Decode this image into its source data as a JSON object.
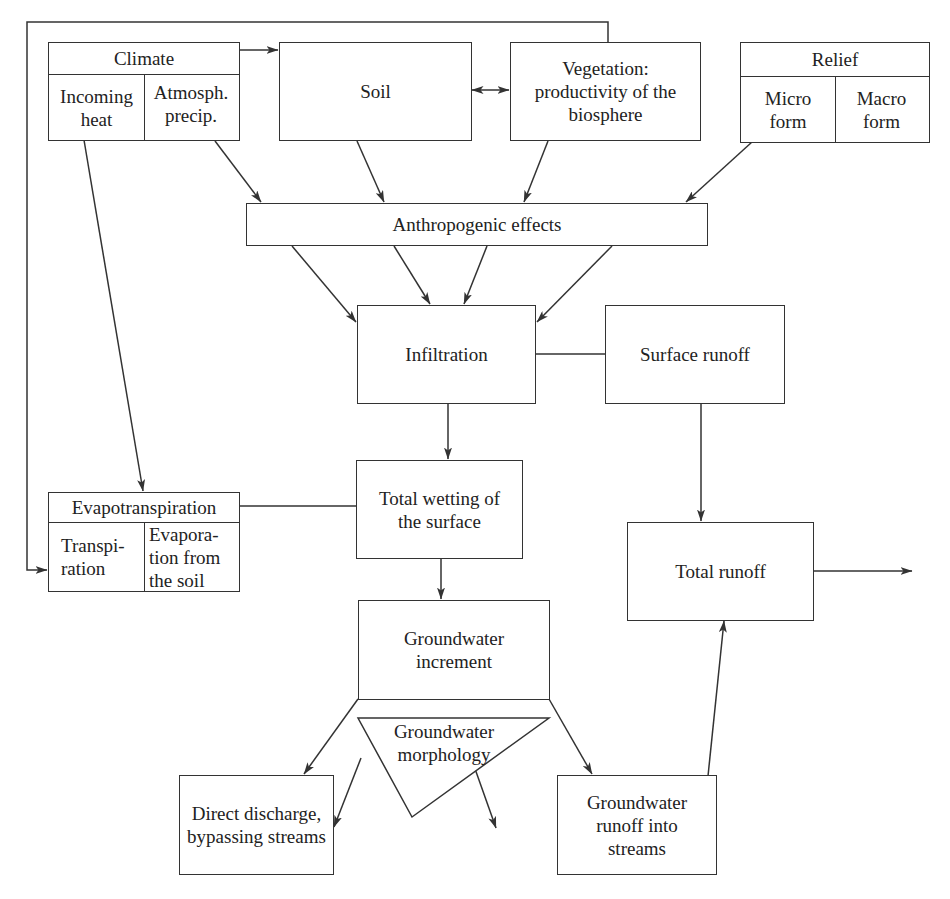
{
  "diagram": {
    "type": "flowchart",
    "colors": {
      "line": "#333333",
      "text": "#222222",
      "background": "#ffffff"
    },
    "nodes": {
      "climate": {
        "title": "Climate",
        "left": "Incoming heat",
        "right": "Atmosph. precip."
      },
      "soil": {
        "label": "Soil"
      },
      "vegetation": {
        "label": "Vegetation: productivity of the biosphere"
      },
      "relief": {
        "title": "Relief",
        "left": "Micro form",
        "right": "Macro form"
      },
      "anthropogenic": {
        "label": "Anthropogenic effects"
      },
      "infiltration": {
        "label": "Infiltration"
      },
      "surface_runoff": {
        "label": "Surface runoff"
      },
      "total_wetting": {
        "label": "Total wetting of the surface"
      },
      "evapotranspiration": {
        "title": "Evapotranspiration",
        "left": "Transpi- ration",
        "right": "Evapora- tion from the soil"
      },
      "total_runoff": {
        "label": "Total runoff"
      },
      "groundwater_increment": {
        "label": "Groundwater increment"
      },
      "groundwater_morphology": {
        "label": "Groundwater morphology"
      },
      "direct_discharge": {
        "label": "Direct discharge, bypassing streams"
      },
      "groundwater_runoff": {
        "label": "Groundwater runoff into streams"
      }
    },
    "edges": [
      {
        "from": "climate",
        "to": "soil",
        "arrow": true
      },
      {
        "from": "soil",
        "to": "vegetation",
        "arrow": "both"
      },
      {
        "from": "vegetation",
        "to": "evapotranspiration",
        "arrow": true,
        "route": "feedback loop over top and down left side"
      },
      {
        "from": "climate.incoming_heat",
        "to": "evapotranspiration",
        "arrow": true
      },
      {
        "from": "climate.atmosph_precip",
        "to": "anthropogenic",
        "arrow": true
      },
      {
        "from": "soil",
        "to": "anthropogenic",
        "arrow": true
      },
      {
        "from": "vegetation",
        "to": "anthropogenic",
        "arrow": true
      },
      {
        "from": "relief",
        "to": "anthropogenic",
        "arrow": true
      },
      {
        "from": "anthropogenic",
        "to": "infiltration",
        "arrow": true,
        "count": 4
      },
      {
        "from": "infiltration",
        "to": "surface_runoff",
        "arrow": false
      },
      {
        "from": "infiltration",
        "to": "total_wetting",
        "arrow": true
      },
      {
        "from": "surface_runoff",
        "to": "total_runoff",
        "arrow": true
      },
      {
        "from": "evapotranspiration",
        "to": "total_wetting",
        "arrow": false
      },
      {
        "from": "total_wetting",
        "to": "groundwater_increment",
        "arrow": true
      },
      {
        "from": "groundwater_increment",
        "to": "direct_discharge",
        "arrow": true
      },
      {
        "from": "groundwater_increment",
        "to": "groundwater_runoff",
        "arrow": true
      },
      {
        "from": "groundwater_morphology",
        "to": "direct_discharge",
        "arrow": true
      },
      {
        "from": "groundwater_morphology",
        "to": "groundwater_runoff",
        "arrow": true
      },
      {
        "from": "groundwater_runoff",
        "to": "total_runoff",
        "arrow": true
      },
      {
        "from": "total_runoff",
        "to": "outflow",
        "arrow": true
      }
    ]
  }
}
